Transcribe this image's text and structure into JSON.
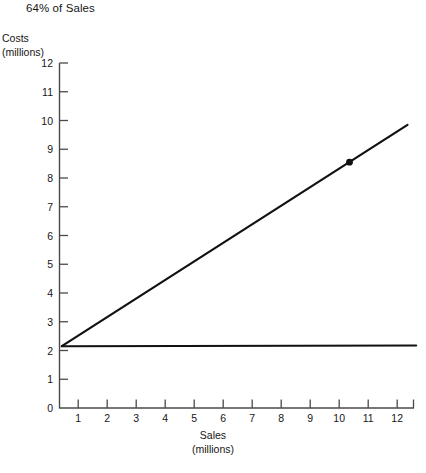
{
  "chart_data": {
    "type": "line",
    "title": "64% of Sales",
    "xlabel": "Sales",
    "xlabel_unit": "(millions)",
    "ylabel": "Costs",
    "ylabel_unit": "(millions)",
    "xlim": [
      0,
      12.6
    ],
    "ylim": [
      0,
      12
    ],
    "xticks": [
      1,
      2,
      3,
      4,
      5,
      6,
      7,
      8,
      9,
      10,
      11,
      12
    ],
    "yticks": [
      0,
      1,
      2,
      3,
      4,
      5,
      6,
      7,
      8,
      9,
      10,
      11,
      12
    ],
    "grid": false,
    "legend": "none",
    "series": [
      {
        "name": "total-cost-line",
        "type": "line",
        "x": [
          0.08,
          12.0
        ],
        "y": [
          2.15,
          9.85
        ],
        "slope": 0.64,
        "intercept": 2.1,
        "color": "#111111"
      },
      {
        "name": "fixed-cost-line",
        "type": "line",
        "x": [
          0.08,
          12.3
        ],
        "y": [
          2.15,
          2.17
        ],
        "slope": 0.0,
        "intercept": 2.15,
        "color": "#111111"
      }
    ],
    "markers": [
      {
        "name": "breakeven-point-marker",
        "x": 10,
        "y": 8.55,
        "series": "total-cost-line",
        "color": "#111111"
      }
    ],
    "axis_color": "#4a4a4a",
    "line_color": "#111111"
  },
  "ticks": {
    "y": [
      "12",
      "11",
      "10",
      "9",
      "8",
      "7",
      "6",
      "5",
      "4",
      "3",
      "2",
      "1",
      "0"
    ],
    "x": [
      "1",
      "2",
      "3",
      "4",
      "5",
      "6",
      "7",
      "8",
      "9",
      "10",
      "11",
      "12"
    ]
  }
}
